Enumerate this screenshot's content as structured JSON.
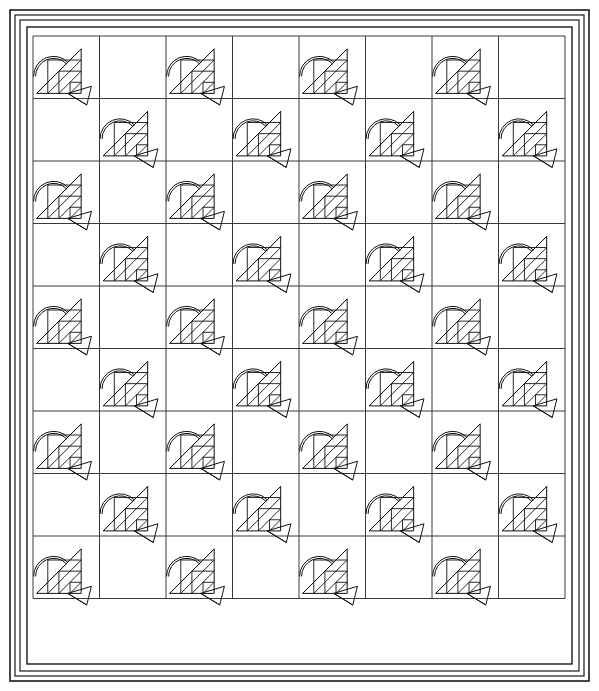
{
  "document": {
    "title": "Basket Quilt Pattern Diagram",
    "type": "line-art quilt layout drawing",
    "background_color": "#ffffff",
    "line_color": "#111111",
    "grid_line_color": "#3a3a3a",
    "width": 599,
    "height": 691
  },
  "borders": {
    "description": "Three nested rectangular border frames around the block field",
    "frames": [
      {
        "name": "outer-border",
        "x": 10,
        "y": 10,
        "width": 579,
        "height": 671,
        "stroke_width": 1.6
      },
      {
        "name": "middle-border",
        "x": 15,
        "y": 15,
        "width": 569,
        "height": 661,
        "stroke_width": 1.2
      },
      {
        "name": "inner-border",
        "x": 20,
        "y": 20,
        "width": 559,
        "height": 651,
        "stroke_width": 1.2
      },
      {
        "name": "field-border",
        "x": 27,
        "y": 27,
        "width": 545,
        "height": 637,
        "stroke_width": 1.4
      }
    ]
  },
  "grid": {
    "columns": 8,
    "rows": 9,
    "origin_x": 33,
    "origin_y": 36,
    "cell_width": 66.5,
    "cell_height": 62.5,
    "pattern": "checkerboard alternating basket blocks and plain blocks",
    "column_labels": [
      "1",
      "2",
      "3",
      "4",
      "5",
      "6",
      "7",
      "8"
    ],
    "row_labels": [
      "1",
      "2",
      "3",
      "4",
      "5",
      "6",
      "7",
      "8",
      "9"
    ],
    "occupancy": [
      [
        1,
        0,
        1,
        0,
        1,
        0,
        1,
        0
      ],
      [
        0,
        1,
        0,
        1,
        0,
        1,
        0,
        1
      ],
      [
        1,
        0,
        1,
        0,
        1,
        0,
        1,
        0
      ],
      [
        0,
        1,
        0,
        1,
        0,
        1,
        0,
        1
      ],
      [
        1,
        0,
        1,
        0,
        1,
        0,
        1,
        0
      ],
      [
        0,
        1,
        0,
        1,
        0,
        1,
        0,
        1
      ],
      [
        1,
        0,
        1,
        0,
        1,
        0,
        1,
        0
      ],
      [
        0,
        1,
        0,
        1,
        0,
        1,
        0,
        1
      ],
      [
        1,
        0,
        1,
        0,
        1,
        0,
        1,
        0
      ]
    ],
    "total_cells": 72,
    "basket_block_count": 36,
    "plain_block_count": 36
  },
  "block_motif": {
    "name": "basket-block",
    "description": "Pieced basket: double-line arc handle, half-square triangle lattice body on a diagonal, and an angular foot extending past the lower-right corner",
    "parts": [
      {
        "name": "handle-arc",
        "shape": "double arc",
        "stroke_width": 1
      },
      {
        "name": "lattice-body",
        "shape": "triangular grid of half-square triangles",
        "rows": 4,
        "columns": 4
      },
      {
        "name": "main-diagonal",
        "shape": "diagonal line from lower-left to upper-right"
      },
      {
        "name": "basket-foot",
        "shape": "quadrilateral wedge at lower right"
      }
    ]
  },
  "chart_data": {
    "type": "table",
    "xlabel": "column",
    "ylabel": "row",
    "categories": [
      "1",
      "2",
      "3",
      "4",
      "5",
      "6",
      "7",
      "8"
    ],
    "values": [
      4,
      5,
      4,
      5,
      4,
      5,
      4,
      5
    ],
    "series": [
      {
        "name": "row 1",
        "values": [
          1,
          0,
          1,
          0,
          1,
          0,
          1,
          0
        ]
      },
      {
        "name": "row 2",
        "values": [
          0,
          1,
          0,
          1,
          0,
          1,
          0,
          1
        ]
      },
      {
        "name": "row 3",
        "values": [
          1,
          0,
          1,
          0,
          1,
          0,
          1,
          0
        ]
      },
      {
        "name": "row 4",
        "values": [
          0,
          1,
          0,
          1,
          0,
          1,
          0,
          1
        ]
      },
      {
        "name": "row 5",
        "values": [
          1,
          0,
          1,
          0,
          1,
          0,
          1,
          0
        ]
      },
      {
        "name": "row 6",
        "values": [
          0,
          1,
          0,
          1,
          0,
          1,
          0,
          1
        ]
      },
      {
        "name": "row 7",
        "values": [
          1,
          0,
          1,
          0,
          1,
          0,
          1,
          0
        ]
      },
      {
        "name": "row 8",
        "values": [
          0,
          1,
          0,
          1,
          0,
          1,
          0,
          1
        ]
      },
      {
        "name": "row 9",
        "values": [
          1,
          0,
          1,
          0,
          1,
          0,
          1,
          0
        ]
      }
    ],
    "legend": [
      "1 = basket block",
      "0 = plain block"
    ],
    "grid": true
  }
}
